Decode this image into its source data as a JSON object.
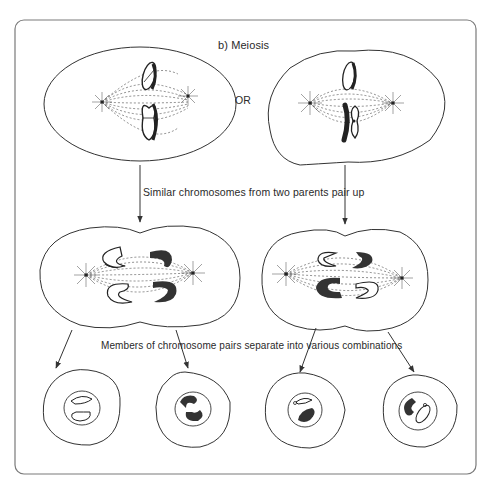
{
  "diagram": {
    "title": "b)  Meiosis",
    "or_label": "OR",
    "step1_caption": "Similar chromosomes from two parents pair up",
    "step2_caption": "Members of chromosome pairs separate into various combinations",
    "colors": {
      "line": "#3a3a3a",
      "chromosome_dark": "#333333",
      "frame": "#7a7a7a",
      "background": "#ffffff"
    },
    "stages": [
      {
        "name": "metaphase-option-a",
        "description": "Cell with two chromosome pairs aligned vertically on spindle"
      },
      {
        "name": "metaphase-option-b",
        "description": "Alternate cell with chromosomes arranged differently on spindle"
      },
      {
        "name": "anaphase-a",
        "description": "Dividing cell, homologous chromosomes separating"
      },
      {
        "name": "anaphase-b",
        "description": "Alternate dividing cell, homologous chromosomes separating"
      },
      {
        "name": "daughter-cells",
        "count": 4,
        "description": "Four daughter cells with various chromosome combinations"
      }
    ]
  }
}
